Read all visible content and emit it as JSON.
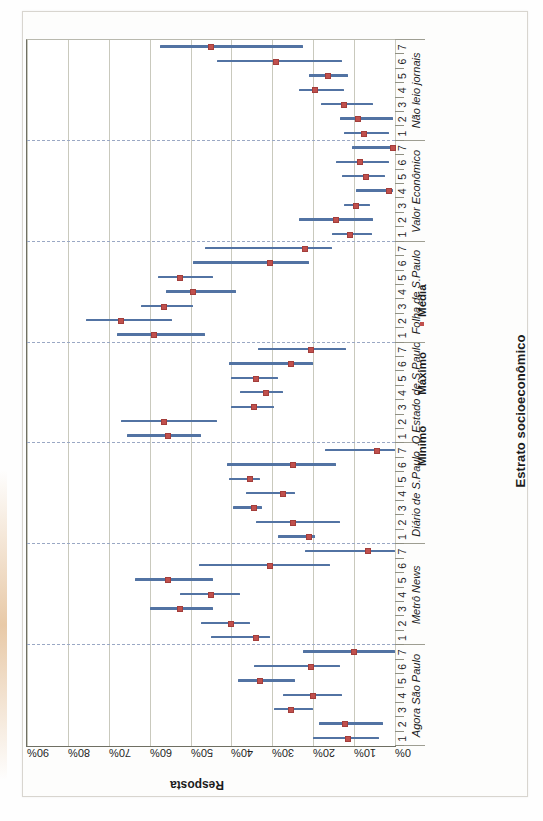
{
  "chart_data": {
    "type": "bar",
    "title": "",
    "xlabel": "Estrato socioeconômico",
    "ylabel": "Resposta",
    "ylim": [
      0,
      90
    ],
    "ytick_labels": [
      "0%",
      "10%",
      "20%",
      "30%",
      "40%",
      "50%",
      "60%",
      "70%",
      "80%",
      "90%"
    ],
    "ytick_values": [
      0,
      10,
      20,
      30,
      40,
      50,
      60,
      70,
      80,
      90
    ],
    "grid": true,
    "legend_position": "below-right",
    "legend": [
      "Mínimo",
      "Máximo",
      "Média"
    ],
    "category_ticks": [
      "1",
      "2",
      "3",
      "4",
      "5",
      "6",
      "7"
    ],
    "groups": [
      {
        "name": "Agora São Paulo",
        "points": [
          {
            "x": "1",
            "min": 4.0,
            "max": 20.0,
            "mean": 11.5
          },
          {
            "x": "2",
            "min": 3.0,
            "max": 18.5,
            "mean": 12.2
          },
          {
            "x": "3",
            "min": 20.0,
            "max": 29.5,
            "mean": 25.5
          },
          {
            "x": "4",
            "min": 13.0,
            "max": 27.5,
            "mean": 20.0
          },
          {
            "x": "5",
            "min": 24.5,
            "max": 38.5,
            "mean": 33.0
          },
          {
            "x": "6",
            "min": 13.5,
            "max": 34.5,
            "mean": 20.5
          },
          {
            "x": "7",
            "min": 0.0,
            "max": 22.5,
            "mean": 10.0
          }
        ]
      },
      {
        "name": "Metrô News",
        "points": [
          {
            "x": "1",
            "min": 30.5,
            "max": 45.0,
            "mean": 34.0
          },
          {
            "x": "2",
            "min": 35.5,
            "max": 47.5,
            "mean": 40.0
          },
          {
            "x": "3",
            "min": 44.5,
            "max": 60.0,
            "mean": 52.5
          },
          {
            "x": "4",
            "min": 38.0,
            "max": 52.5,
            "mean": 45.0
          },
          {
            "x": "5",
            "min": 44.5,
            "max": 63.5,
            "mean": 55.5
          },
          {
            "x": "6",
            "min": 16.0,
            "max": 48.0,
            "mean": 30.5
          },
          {
            "x": "7",
            "min": 0.0,
            "max": 22.0,
            "mean": 6.5
          }
        ]
      },
      {
        "name": "Diário de S.Paulo",
        "points": [
          {
            "x": "1",
            "min": 19.5,
            "max": 28.5,
            "mean": 21.0
          },
          {
            "x": "2",
            "min": 13.5,
            "max": 34.0,
            "mean": 25.0
          },
          {
            "x": "3",
            "min": 32.5,
            "max": 39.5,
            "mean": 34.5
          },
          {
            "x": "4",
            "min": 24.5,
            "max": 36.5,
            "mean": 27.5
          },
          {
            "x": "5",
            "min": 33.0,
            "max": 40.5,
            "mean": 35.5
          },
          {
            "x": "6",
            "min": 14.5,
            "max": 41.0,
            "mean": 25.0
          },
          {
            "x": "7",
            "min": 0.0,
            "max": 17.0,
            "mean": 4.5
          }
        ]
      },
      {
        "name": "O Estado de S.Paulo",
        "points": [
          {
            "x": "1",
            "min": 47.5,
            "max": 65.5,
            "mean": 55.5
          },
          {
            "x": "2",
            "min": 43.5,
            "max": 67.0,
            "mean": 56.5
          },
          {
            "x": "3",
            "min": 29.5,
            "max": 40.0,
            "mean": 34.5
          },
          {
            "x": "4",
            "min": 27.5,
            "max": 38.0,
            "mean": 31.5
          },
          {
            "x": "5",
            "min": 28.5,
            "max": 40.0,
            "mean": 34.0
          },
          {
            "x": "6",
            "min": 20.0,
            "max": 40.5,
            "mean": 25.5
          },
          {
            "x": "7",
            "min": 12.0,
            "max": 33.5,
            "mean": 20.5
          }
        ]
      },
      {
        "name": "Folha de S.Paulo",
        "points": [
          {
            "x": "1",
            "min": 46.5,
            "max": 68.0,
            "mean": 59.0
          },
          {
            "x": "2",
            "min": 54.5,
            "max": 75.5,
            "mean": 67.0
          },
          {
            "x": "3",
            "min": 49.5,
            "max": 62.0,
            "mean": 56.5
          },
          {
            "x": "4",
            "min": 39.0,
            "max": 56.0,
            "mean": 49.5
          },
          {
            "x": "5",
            "min": 44.5,
            "max": 58.0,
            "mean": 52.5
          },
          {
            "x": "6",
            "min": 21.0,
            "max": 49.5,
            "mean": 30.5
          },
          {
            "x": "7",
            "min": 15.5,
            "max": 46.5,
            "mean": 22.0
          }
        ]
      },
      {
        "name": "Valor Econômico",
        "points": [
          {
            "x": "1",
            "min": 5.5,
            "max": 15.5,
            "mean": 11.0
          },
          {
            "x": "2",
            "min": 5.5,
            "max": 23.5,
            "mean": 14.5
          },
          {
            "x": "3",
            "min": 6.0,
            "max": 12.5,
            "mean": 9.5
          },
          {
            "x": "4",
            "min": 0.5,
            "max": 9.5,
            "mean": 1.5
          },
          {
            "x": "5",
            "min": 2.5,
            "max": 13.0,
            "mean": 7.0
          },
          {
            "x": "6",
            "min": 1.5,
            "max": 14.5,
            "mean": 8.5
          },
          {
            "x": "7",
            "min": 0.0,
            "max": 10.5,
            "mean": 0.5
          }
        ]
      },
      {
        "name": "Não leio jornais",
        "points": [
          {
            "x": "1",
            "min": 1.5,
            "max": 12.5,
            "mean": 7.5
          },
          {
            "x": "2",
            "min": 0.5,
            "max": 13.5,
            "mean": 9.0
          },
          {
            "x": "3",
            "min": 5.5,
            "max": 18.0,
            "mean": 12.5
          },
          {
            "x": "4",
            "min": 12.5,
            "max": 23.5,
            "mean": 19.5
          },
          {
            "x": "5",
            "min": 11.5,
            "max": 21.0,
            "mean": 16.5
          },
          {
            "x": "6",
            "min": 13.0,
            "max": 43.5,
            "mean": 29.0
          },
          {
            "x": "7",
            "min": 22.5,
            "max": 57.5,
            "mean": 45.0
          }
        ]
      }
    ]
  },
  "colors": {
    "range_line": "#5273a3",
    "mean_marker": "#c0504d",
    "gridline": "#c9c9bd",
    "group_separator": "#9aa8c4",
    "axis": "#6f6f63",
    "text": "#1c1c1c"
  }
}
